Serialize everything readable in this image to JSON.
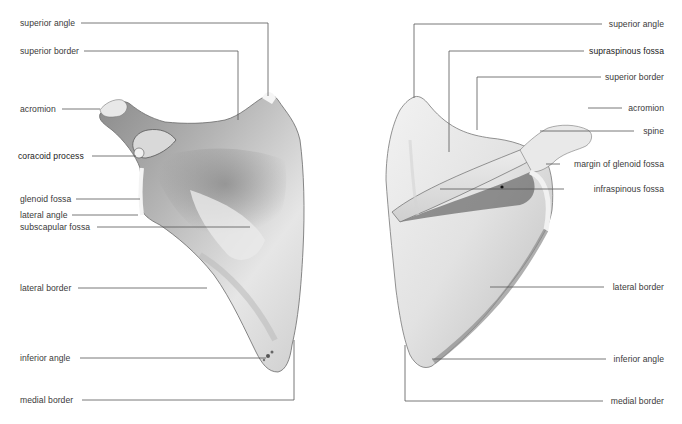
{
  "figure": {
    "top_caption_fragment": "...",
    "views": [
      {
        "id": "anterior",
        "description": "Left scapula, costal (anterior) surface",
        "labels": [
          {
            "text": "superior angle",
            "x": 20,
            "y": 18
          },
          {
            "text": "superior border",
            "x": 20,
            "y": 46
          },
          {
            "text": "acromion",
            "x": 20,
            "y": 104
          },
          {
            "text": "coracoid process",
            "x": 18,
            "y": 151
          },
          {
            "text": "glenoid fossa",
            "x": 20,
            "y": 194
          },
          {
            "text": "lateral angle",
            "x": 20,
            "y": 211
          },
          {
            "text": "subscapular fossa",
            "x": 20,
            "y": 222
          },
          {
            "text": "lateral border",
            "x": 20,
            "y": 283
          },
          {
            "text": "inferior angle",
            "x": 20,
            "y": 353
          },
          {
            "text": "medial border",
            "x": 20,
            "y": 395
          }
        ]
      },
      {
        "id": "posterior",
        "description": "Left scapula, dorsal (posterior) surface",
        "labels": [
          {
            "text": "superior angle",
            "right": 18,
            "y": 18
          },
          {
            "text": "supraspinous fossa",
            "right": 18,
            "y": 46
          },
          {
            "text": "superior border",
            "right": 18,
            "y": 72
          },
          {
            "text": "acromion",
            "right": 18,
            "y": 102
          },
          {
            "text": "spine",
            "right": 18,
            "y": 124
          },
          {
            "text": "margin of glenoid fossa",
            "right": 18,
            "y": 161
          },
          {
            "text": "infraspinous fossa",
            "right": 18,
            "y": 184
          },
          {
            "text": "lateral border",
            "right": 18,
            "y": 283
          },
          {
            "text": "inferior angle",
            "right": 18,
            "y": 353
          },
          {
            "text": "medial border",
            "right": 18,
            "y": 395
          }
        ]
      }
    ],
    "colors": {
      "leader_line": "#555555",
      "label_text": "#3a3a3a",
      "bone_light": "#f2f2f2",
      "bone_mid": "#c9c9c9",
      "bone_dark": "#7a7a7a"
    }
  }
}
